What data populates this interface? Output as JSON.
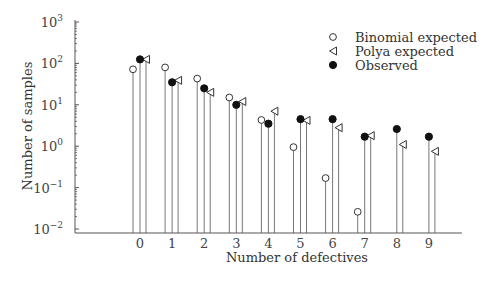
{
  "chart_data": {
    "type": "scatter",
    "subtype": "log-scale stem plot",
    "title": "",
    "xlabel": "Number of defectives",
    "ylabel": "Number of samples",
    "yscale": "log",
    "ylim": [
      0.01,
      1000
    ],
    "y_ticks": [
      {
        "base": "10",
        "exp": "3",
        "value": 1000
      },
      {
        "base": "10",
        "exp": "2",
        "value": 100
      },
      {
        "base": "10",
        "exp": "1",
        "value": 10
      },
      {
        "base": "10",
        "exp": "0",
        "value": 1
      },
      {
        "base": "10",
        "exp": "−1",
        "value": 0.1
      },
      {
        "base": "10",
        "exp": "−2",
        "value": 0.01
      }
    ],
    "categories": [
      "0",
      "1",
      "2",
      "3",
      "4",
      "5",
      "6",
      "7",
      "8",
      "9"
    ],
    "grid": false,
    "legend_position": "upper right",
    "series": [
      {
        "name": "Binomial expected",
        "marker": "open-circle",
        "offset": -7,
        "values": [
          72,
          80,
          43,
          15,
          4.3,
          0.95,
          0.17,
          0.026,
          null,
          null
        ]
      },
      {
        "name": "Polya expected",
        "marker": "open-left-triangle",
        "offset": 6,
        "values": [
          125,
          39,
          20,
          12,
          7,
          4.2,
          2.8,
          1.8,
          1.1,
          0.75
        ]
      },
      {
        "name": "Observed",
        "marker": "filled-circle",
        "offset": 0,
        "values": [
          125,
          35,
          25,
          10,
          3.5,
          4.5,
          4.5,
          1.7,
          2.6,
          1.7
        ]
      }
    ]
  },
  "legend": {
    "items": [
      {
        "label": "Binomial expected",
        "marker": "open-circle"
      },
      {
        "label": "Polya expected",
        "marker": "open-left-triangle"
      },
      {
        "label": "Observed",
        "marker": "filled-circle"
      }
    ]
  },
  "axes": {
    "x_title": "Number of defectives",
    "y_title": "Number of samples"
  }
}
